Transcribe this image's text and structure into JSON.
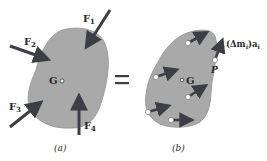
{
  "figure": {
    "panel_a": {
      "caption": "(a)",
      "center_label": "G",
      "forces": [
        {
          "name": "F",
          "sub": "1"
        },
        {
          "name": "F",
          "sub": "2"
        },
        {
          "name": "F",
          "sub": "3"
        },
        {
          "name": "F",
          "sub": "4"
        }
      ]
    },
    "equals_sign": "=",
    "panel_b": {
      "caption": "(b)",
      "center_label": "G",
      "point_label": "P",
      "vector_label": "(Δm",
      "vector_label_sub": "i",
      "vector_label_tail": ")a",
      "vector_label_tail_sub": "i"
    },
    "colors": {
      "body_fill": "#a9a9a9",
      "body_edge": "#9c9c9c",
      "arrow": "#3d3d45",
      "particle": "#ffffff",
      "text": "#2a2a2a"
    }
  }
}
